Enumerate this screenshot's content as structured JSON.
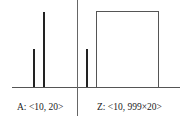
{
  "panels": [
    {
      "id": "A",
      "label": "A: <10, 20>",
      "bars": [
        {
          "value": 10,
          "color": "#222222"
        },
        {
          "value": 20,
          "color": "#222222"
        }
      ]
    },
    {
      "id": "Z",
      "label": "Z: <10, 999×20>",
      "bars": [
        {
          "value": 10,
          "color": "#222222"
        },
        {
          "value": "999×20",
          "shape": "wide box",
          "color": "#555555"
        }
      ]
    }
  ]
}
